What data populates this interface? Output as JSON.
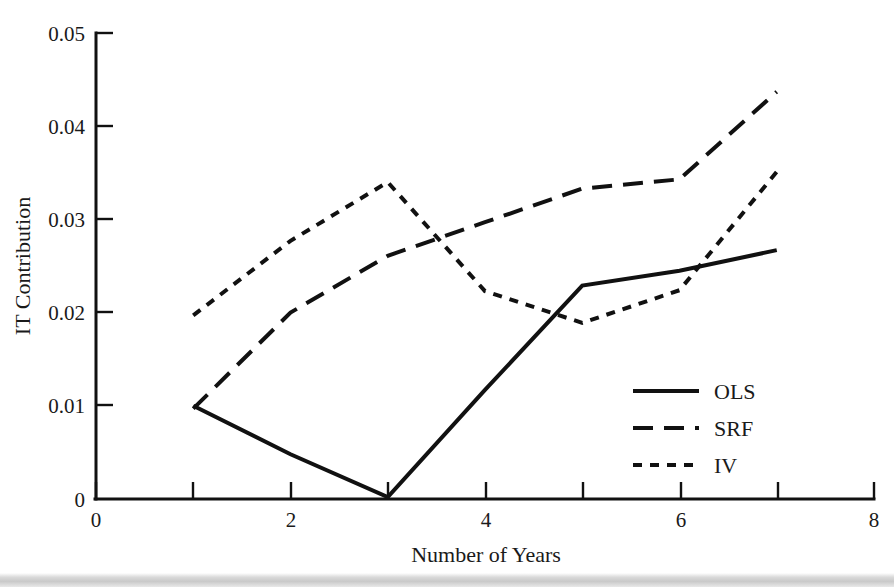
{
  "chart_data": {
    "type": "line",
    "title": "",
    "xlabel": "Number of Years",
    "ylabel": "IT Contribution",
    "xlim": [
      0,
      8
    ],
    "ylim": [
      0,
      0.05
    ],
    "grid": false,
    "legend_position": "center-right",
    "x_ticks": [
      0,
      1,
      2,
      3,
      4,
      5,
      6,
      7,
      8
    ],
    "x_tick_labels": [
      "0",
      "",
      "2",
      "",
      "4",
      "",
      "6",
      "",
      "8"
    ],
    "y_ticks": [
      0,
      0.01,
      0.02,
      0.03,
      0.04,
      0.05
    ],
    "y_tick_labels": [
      "0",
      "0.01",
      "0.02",
      "0.03",
      "0.04",
      "0.05"
    ],
    "x": [
      1,
      2,
      3,
      4,
      5,
      6,
      7
    ],
    "series": [
      {
        "name": "OLS",
        "style": "solid",
        "values": [
          0.01,
          0.0048,
          0.0002,
          0.0117,
          0.0229,
          0.0245,
          0.0267
        ]
      },
      {
        "name": "SRF",
        "style": "dashed",
        "values": [
          0.0097,
          0.02,
          0.0261,
          0.0297,
          0.0333,
          0.0343,
          0.0437
        ]
      },
      {
        "name": "IV",
        "style": "dotted",
        "values": [
          0.0197,
          0.0277,
          0.034,
          0.0223,
          0.0189,
          0.0224,
          0.0351
        ]
      }
    ]
  },
  "axes": {
    "y_label": "IT Contribution",
    "x_label": "Number of Years",
    "y_tick_labels": [
      "0.05",
      "0.04",
      "0.03",
      "0.02",
      "0.01",
      "0"
    ],
    "x_tick_labels": [
      "0",
      "2",
      "4",
      "6",
      "8"
    ]
  },
  "legend": {
    "entries": [
      {
        "label": "OLS",
        "style": "solid"
      },
      {
        "label": "SRF",
        "style": "dashed"
      },
      {
        "label": "IV",
        "style": "dotted"
      }
    ]
  },
  "colors": {
    "line": "#111111",
    "text": "#1a1a1a",
    "background": "#ffffff",
    "band": "#cfcfcf"
  }
}
